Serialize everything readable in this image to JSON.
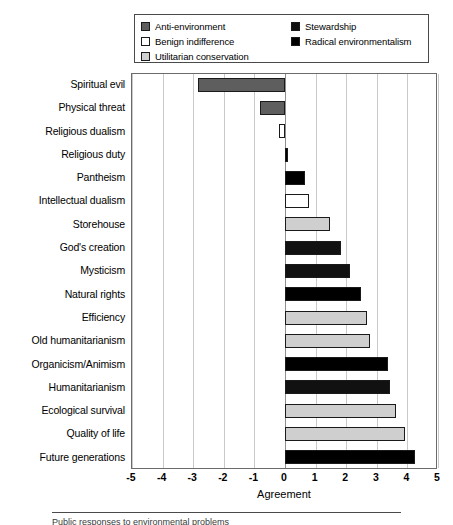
{
  "chart_data": {
    "type": "bar",
    "orientation": "horizontal",
    "title": "",
    "xlabel": "Agreement",
    "ylabel": "",
    "xlim": [
      -5,
      5
    ],
    "xticks": [
      -5,
      -4,
      -3,
      -2,
      -1,
      0,
      1,
      2,
      3,
      4,
      5
    ],
    "xtick_labels": [
      "-5",
      "-4",
      "-3",
      "-2",
      "-1",
      "0",
      "1",
      "2",
      "3",
      "4",
      "5"
    ],
    "grid": true,
    "grid_axis": "x",
    "legend_position": "top",
    "categories": [
      "Spiritual evil",
      "Physical threat",
      "Religious dualism",
      "Religious duty",
      "Pantheism",
      "Intellectual dualism",
      "Storehouse",
      "God's creation",
      "Mysticism",
      "Natural rights",
      "Efficiency",
      "Old humanitarianism",
      "Organicism/Animism",
      "Humanitarianism",
      "Ecological survival",
      "Quality of life",
      "Future generations"
    ],
    "values": [
      -2.83,
      -0.82,
      -0.21,
      0.1,
      0.66,
      0.78,
      1.46,
      1.83,
      2.11,
      2.49,
      2.67,
      2.77,
      3.37,
      3.44,
      3.63,
      3.91,
      4.26
    ],
    "point_categories": [
      "Anti-environment",
      "Anti-environment",
      "Benign indifference",
      "Radical environmentalism",
      "Radical environmentalism",
      "Benign indifference",
      "Utilitarian conservation",
      "Stewardship",
      "Stewardship",
      "Radical environmentalism",
      "Utilitarian conservation",
      "Utilitarian conservation",
      "Radical environmentalism",
      "Stewardship",
      "Utilitarian conservation",
      "Utilitarian conservation",
      "Radical environmentalism"
    ]
  },
  "legend": {
    "column_a": [
      {
        "label": "Anti-environment",
        "color": "#5e5e5e"
      },
      {
        "label": "Benign indifference",
        "color": "#ffffff"
      },
      {
        "label": "Utilitarian conservation",
        "color": "#cfcfcf"
      }
    ],
    "column_b": [
      {
        "label": "Stewardship",
        "color": "#111111"
      },
      {
        "label": "Radical environmentalism",
        "color": "#000000"
      }
    ]
  },
  "axis": {
    "x_title": "Agreement",
    "x_tick_labels": [
      "-5",
      "-4",
      "-3",
      "-2",
      "-1",
      "0",
      "1",
      "2",
      "3",
      "4",
      "5"
    ]
  },
  "y_axis_labels": [
    "Spiritual evil",
    "Physical threat",
    "Religious dualism",
    "Religious duty",
    "Pantheism",
    "Intellectual dualism",
    "Storehouse",
    "God's creation",
    "Mysticism",
    "Natural rights",
    "Efficiency",
    "Old humanitarianism",
    "Organicism/Animism",
    "Humanitarianism",
    "Ecological survival",
    "Quality of life",
    "Future generations"
  ],
  "caption": "Public responses to environmental problems"
}
